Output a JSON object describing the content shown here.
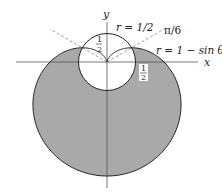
{
  "figure": {
    "axes": {
      "x_label": "x",
      "y_label": "y"
    },
    "curves": [
      {
        "name": "circle",
        "label": "r = 1/2"
      },
      {
        "name": "cardioid",
        "label": "r = 1 − sin θ"
      }
    ],
    "angle_label": "π/6",
    "radius_labels": [
      {
        "num": "1",
        "den": "2",
        "position": "inside circle, above origin"
      },
      {
        "num": "1",
        "den": "2",
        "position": "right of circle, below x-axis"
      }
    ],
    "colors": {
      "shade": "#a9a9a9",
      "stroke": "#222222",
      "axis": "#555555",
      "dash": "#888888"
    }
  }
}
